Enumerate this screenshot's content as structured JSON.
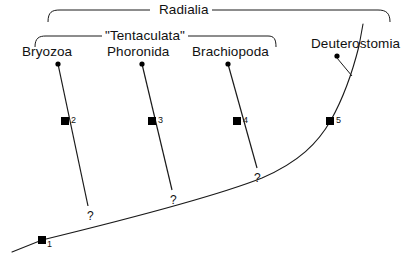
{
  "figure": {
    "type": "cladogram",
    "background_color": "#ffffff",
    "line_color": "#1a1a1a",
    "node_color": "#000000"
  },
  "clades": [
    {
      "id": "radialia",
      "label": "Radialia",
      "bracket": {
        "left_x": 48,
        "right_x": 390,
        "top_y": 10,
        "tip_drop": 12
      },
      "label_x": 161,
      "label_y": 4
    },
    {
      "id": "tentaculata",
      "label": "\"Tentaculata\"",
      "bracket": {
        "left_x": 35,
        "right_x": 276,
        "top_y": 36,
        "tip_drop": 10
      },
      "label_x": 111,
      "label_y": 30
    }
  ],
  "taxa": [
    {
      "id": "bryozoa",
      "label": "Bryozoa",
      "label_x": 23,
      "label_y": 46,
      "tip_x": 58,
      "tip_y": 64,
      "node_x": 65,
      "node_y": 121,
      "number": "2",
      "base_x": 88,
      "base_y": 212,
      "question": "?",
      "q_x": 89,
      "q_y": 214
    },
    {
      "id": "phoronida",
      "label": "Phoronida",
      "label_x": 108,
      "label_y": 46,
      "tip_x": 142,
      "tip_y": 64,
      "node_x": 152,
      "node_y": 121,
      "number": "3",
      "base_x": 172,
      "base_y": 196,
      "question": "?",
      "q_x": 171,
      "q_y": 198
    },
    {
      "id": "brachiopoda",
      "label": "Brachiopoda",
      "label_x": 193,
      "label_y": 46,
      "tip_x": 228,
      "tip_y": 64,
      "node_x": 237,
      "node_y": 121,
      "number": "4",
      "base_x": 257,
      "base_y": 174,
      "question": "?",
      "q_x": 255,
      "q_y": 176
    },
    {
      "id": "deuterostomia",
      "label": "Deuterostomia",
      "label_x": 312,
      "label_y": 38,
      "tip_x": 337,
      "tip_y": 56,
      "node_x": 330,
      "node_y": 121,
      "number": "5",
      "base_x": 290,
      "base_y": 196,
      "question": "",
      "q_x": 0,
      "q_y": 0
    }
  ],
  "root_node": {
    "id": "root",
    "number": "1",
    "x": 42,
    "y": 240,
    "stem_start_x": 12,
    "stem_start_y": 252
  },
  "backbone": {
    "description": "main lineage from root curving up to Deuterostomia",
    "path": "M 12 252 L 42 240 C 120 220 215 196 262 177 C 300 161 318 140 330 121 C 344 98 352 72 358 48 L 362 26"
  },
  "numbers": [
    "1",
    "2",
    "3",
    "4",
    "5"
  ],
  "question_marks": [
    "?",
    "?",
    "?"
  ]
}
